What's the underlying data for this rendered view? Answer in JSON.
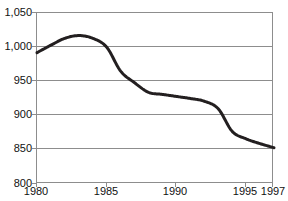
{
  "title": "",
  "axes": {
    "y_label": "",
    "x_label": "",
    "y_ticks": [
      "800",
      "850",
      "900",
      "950",
      "1,000",
      "1,050"
    ],
    "x_ticks": [
      "1980",
      "1985",
      "1990",
      "1995",
      "1997"
    ]
  },
  "colors": {
    "line": "#231f20",
    "grid": "#8d8d8d",
    "frame": "#8d8d8d",
    "background": "#ffffff",
    "text": "#111111"
  },
  "chart_data": {
    "type": "line",
    "title": "",
    "xlabel": "",
    "ylabel": "",
    "xlim": [
      1980,
      1997
    ],
    "ylim": [
      800,
      1050
    ],
    "grid": true,
    "legend": "none",
    "y_tick_values": [
      800,
      850,
      900,
      950,
      1000,
      1050
    ],
    "x_tick_values": [
      1980,
      1985,
      1990,
      1995,
      1997
    ],
    "x": [
      1980,
      1981,
      1982,
      1983,
      1984,
      1985,
      1986,
      1987,
      1988,
      1989,
      1990,
      1991,
      1992,
      1993,
      1994,
      1995,
      1996,
      1997
    ],
    "series": [
      {
        "name": "series-1",
        "values": [
          992,
          1003,
          1013,
          1017,
          1013,
          1000,
          965,
          948,
          934,
          931,
          928,
          925,
          921,
          910,
          877,
          866,
          859,
          853
        ]
      }
    ]
  }
}
